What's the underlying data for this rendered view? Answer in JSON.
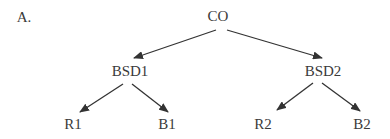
{
  "panel_label": "A.",
  "colors": {
    "text": "#3a3a3a",
    "edge": "#333333"
  },
  "nodes": [
    {
      "id": "CO",
      "label": "CO",
      "x": 218,
      "y": 9
    },
    {
      "id": "BSD1",
      "label": "BSD1",
      "x": 130,
      "y": 64
    },
    {
      "id": "BSD2",
      "label": "BSD2",
      "x": 323,
      "y": 64
    },
    {
      "id": "R1",
      "label": "R1",
      "x": 73,
      "y": 117
    },
    {
      "id": "B1",
      "label": "B1",
      "x": 167,
      "y": 117
    },
    {
      "id": "R2",
      "label": "R2",
      "x": 263,
      "y": 117
    },
    {
      "id": "B2",
      "label": "B2",
      "x": 362,
      "y": 117
    }
  ],
  "edges": [
    {
      "from": "CO",
      "to": "BSD1"
    },
    {
      "from": "CO",
      "to": "BSD2"
    },
    {
      "from": "BSD1",
      "to": "R1"
    },
    {
      "from": "BSD1",
      "to": "B1"
    },
    {
      "from": "BSD2",
      "to": "R2"
    },
    {
      "from": "BSD2",
      "to": "B2"
    }
  ]
}
